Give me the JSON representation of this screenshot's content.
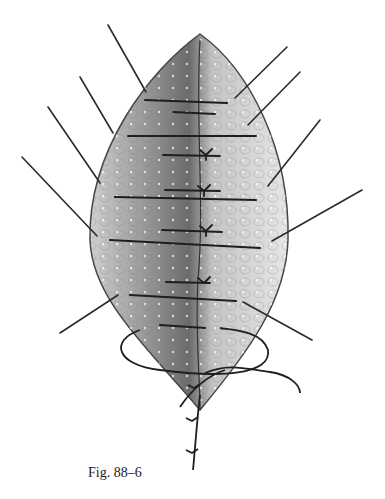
{
  "figure": {
    "caption": "Fig. 88–6",
    "colors": {
      "tissue_light": "#d9d9d9",
      "tissue_mid": "#a8a8a8",
      "tissue_dark": "#5a5a5a",
      "suture": "#1e1e1e",
      "background": "#ffffff"
    }
  }
}
